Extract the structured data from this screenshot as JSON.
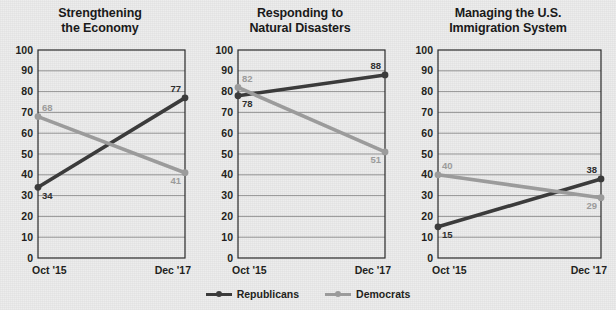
{
  "legend": {
    "items": [
      {
        "label": "Republicans",
        "color": "#3b3b3b",
        "key": "republicans"
      },
      {
        "label": "Democrats",
        "color": "#9b9b9b",
        "key": "democrats"
      }
    ]
  },
  "axis": {
    "yticks": [
      "100",
      "90",
      "80",
      "70",
      "60",
      "50",
      "40",
      "30",
      "20",
      "10",
      "0"
    ],
    "xticks": [
      "Oct '15",
      "Dec '17"
    ]
  },
  "chart_data": [
    {
      "type": "line",
      "title": "Strengthening the Economy",
      "title_lines": [
        "Strengthening",
        "the Economy"
      ],
      "x": [
        "Oct '15",
        "Dec '17"
      ],
      "xlabel": "",
      "ylabel": "",
      "ylim": [
        0,
        100
      ],
      "ytick_step": 10,
      "grid": true,
      "legend_position": "bottom",
      "series": [
        {
          "name": "Republicans",
          "color": "#3b3b3b",
          "values": [
            34,
            77
          ],
          "labels": [
            "34",
            "77"
          ]
        },
        {
          "name": "Democrats",
          "color": "#9b9b9b",
          "values": [
            68,
            41
          ],
          "labels": [
            "68",
            "41"
          ]
        }
      ]
    },
    {
      "type": "line",
      "title": "Responding to Natural Disasters",
      "title_lines": [
        "Responding to",
        "Natural Disasters"
      ],
      "x": [
        "Oct '15",
        "Dec '17"
      ],
      "xlabel": "",
      "ylabel": "",
      "ylim": [
        0,
        100
      ],
      "ytick_step": 10,
      "grid": true,
      "legend_position": "bottom",
      "series": [
        {
          "name": "Republicans",
          "color": "#3b3b3b",
          "values": [
            78,
            88
          ],
          "labels": [
            "78",
            "88"
          ]
        },
        {
          "name": "Democrats",
          "color": "#9b9b9b",
          "values": [
            82,
            51
          ],
          "labels": [
            "82",
            "51"
          ]
        }
      ]
    },
    {
      "type": "line",
      "title": "Managing the U.S. Immigration System",
      "title_lines": [
        "Managing the U.S.",
        "Immigration System"
      ],
      "x": [
        "Oct '15",
        "Dec '17"
      ],
      "xlabel": "",
      "ylabel": "",
      "ylim": [
        0,
        100
      ],
      "ytick_step": 10,
      "grid": true,
      "legend_position": "bottom",
      "series": [
        {
          "name": "Republicans",
          "color": "#3b3b3b",
          "values": [
            15,
            38
          ],
          "labels": [
            "15",
            "38"
          ]
        },
        {
          "name": "Democrats",
          "color": "#9b9b9b",
          "values": [
            40,
            29
          ],
          "labels": [
            "40",
            "29"
          ]
        }
      ]
    }
  ]
}
